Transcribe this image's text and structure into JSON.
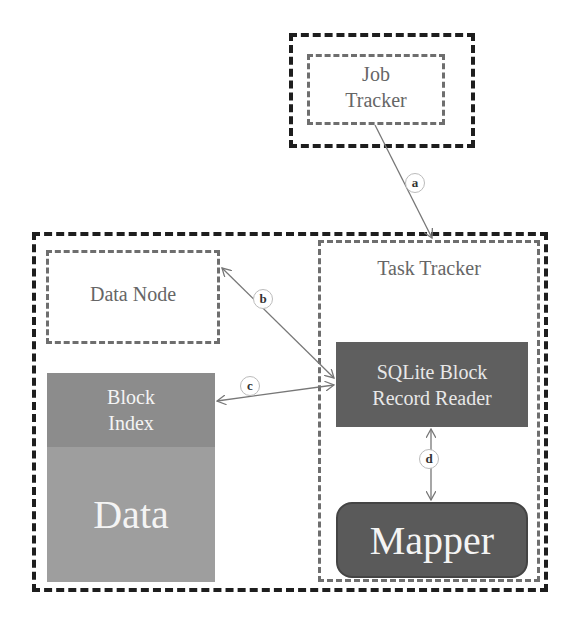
{
  "nodes": {
    "job_tracker": {
      "line1": "Job",
      "line2": "Tracker"
    },
    "data_node": {
      "label": "Data Node"
    },
    "task_tracker": {
      "label": "Task Tracker"
    },
    "block_index": {
      "line1": "Block",
      "line2": "Index"
    },
    "data": {
      "label": "Data"
    },
    "sqlite_reader": {
      "line1": "SQLite Block",
      "line2": "Record Reader"
    },
    "mapper": {
      "label": "Mapper"
    }
  },
  "edges": [
    {
      "id": "a",
      "label": "a",
      "from": "job_tracker",
      "to": "task_tracker"
    },
    {
      "id": "b",
      "label": "b",
      "from": "data_node",
      "to": "sqlite_reader"
    },
    {
      "id": "c",
      "label": "c",
      "from": "sqlite_reader",
      "to": "block_index"
    },
    {
      "id": "d",
      "label": "d",
      "from": "sqlite_reader",
      "to": "mapper"
    }
  ],
  "colors": {
    "outer_border": "#1e1e1e",
    "inner_border": "#6e6e6e",
    "block_index_fill": "#8c8c8c",
    "data_fill": "#9e9e9e",
    "sqlite_reader_fill": "#5f5f5f",
    "mapper_fill": "#5a5a5a"
  }
}
